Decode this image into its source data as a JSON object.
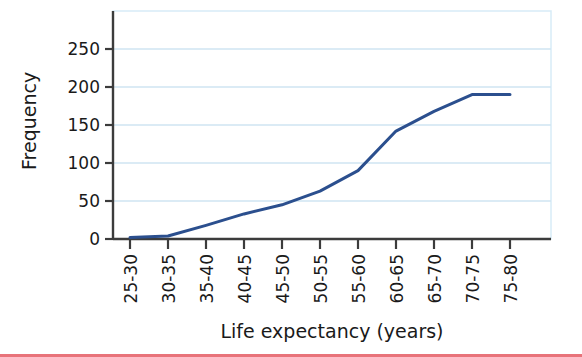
{
  "figure": {
    "background_color": "#ffffff",
    "bottom_rule_color": "#e8737a"
  },
  "chart_data": {
    "type": "line",
    "title": "",
    "subtitle": "",
    "xlabel": "Life expectancy (years)",
    "ylabel": "Frequency",
    "categories": [
      "25-30",
      "30-35",
      "35-40",
      "40-45",
      "45-50",
      "50-55",
      "55-60",
      "60-65",
      "65-70",
      "70-75",
      "75-80"
    ],
    "values": [
      2,
      4,
      18,
      33,
      45,
      63,
      90,
      142,
      168,
      190,
      190
    ],
    "series": [
      {
        "name": "Cumulative frequency",
        "values": [
          2,
          4,
          18,
          33,
          45,
          63,
          90,
          142,
          168,
          190,
          190
        ],
        "color": "#2b4f8e",
        "line_width": 3
      }
    ],
    "ylim": [
      0,
      275
    ],
    "yticks": [
      0,
      50,
      100,
      150,
      200,
      250
    ],
    "ytick_labels": [
      "0",
      "50",
      "100",
      "150",
      "200",
      "250"
    ],
    "grid": true,
    "grid_color": "#cfe5f2",
    "grid_axis": "y",
    "legend": false,
    "legend_position": "none",
    "axis_color": "#3c3c3c",
    "plot_border_color": "#d7ecf7"
  },
  "axes": {
    "x_title": "Life expectancy (years)",
    "y_title": "Frequency",
    "x_tick_rotation": -90
  }
}
